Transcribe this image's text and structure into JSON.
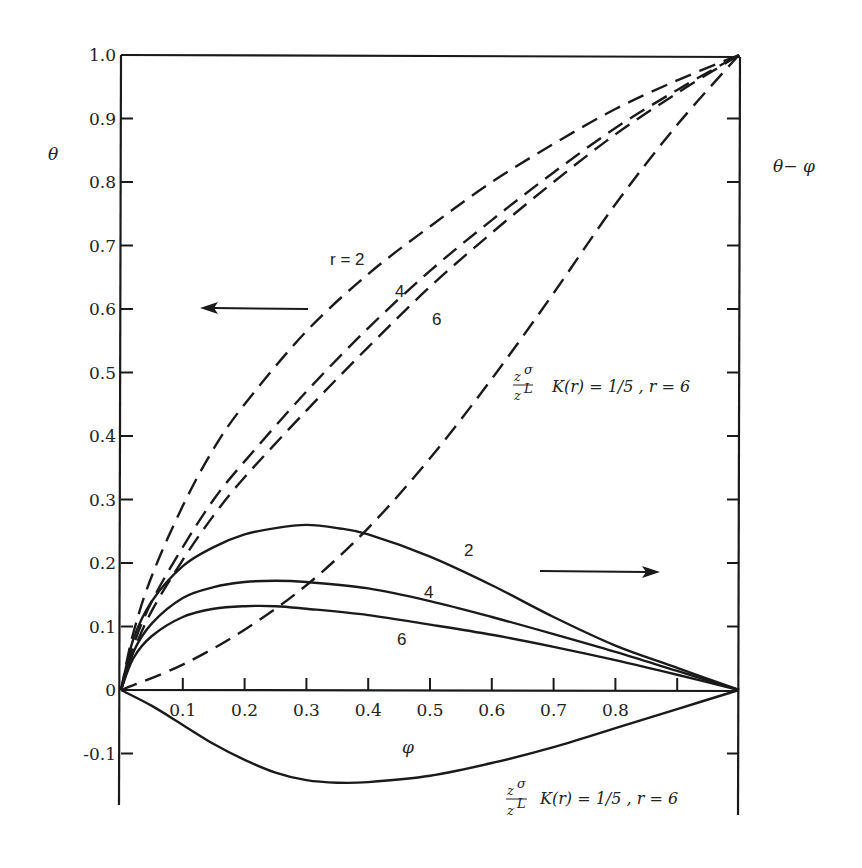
{
  "chart_data": {
    "type": "line",
    "title": "",
    "xlabel": "φ",
    "ylabel_left": "θ",
    "ylabel_right": "θ − φ",
    "xlim": [
      0,
      1.0
    ],
    "ylim": [
      -0.15,
      1.0
    ],
    "grid": false,
    "x_ticks": [
      0.1,
      0.2,
      0.3,
      0.4,
      0.5,
      0.6,
      0.7,
      0.8,
      0.9
    ],
    "x_tick_labels": [
      "0.1",
      "0.2",
      "0.3",
      "0.4",
      "0.5",
      "0.6",
      "0.7",
      "0.8"
    ],
    "y_ticks": [
      -0.1,
      0,
      0.1,
      0.2,
      0.3,
      0.4,
      0.5,
      0.6,
      0.7,
      0.8,
      0.9,
      1.0
    ],
    "y_tick_labels": [
      "-0.1",
      "0",
      "0.1",
      "0.2",
      "0.3",
      "0.4",
      "0.5",
      "0.6",
      "0.7",
      "0.8",
      "0.9",
      "1.0"
    ],
    "arrows": [
      {
        "direction": "left",
        "meaning": "dashed curves read on θ axis (left)"
      },
      {
        "direction": "right",
        "meaning": "solid curves read on θ−φ axis (right)"
      }
    ],
    "series": [
      {
        "name": "θ, r = 2",
        "style": "dashed",
        "axis": "left",
        "x": [
          0,
          0.02,
          0.05,
          0.1,
          0.15,
          0.2,
          0.3,
          0.4,
          0.5,
          0.6,
          0.7,
          0.8,
          0.9,
          1.0
        ],
        "y": [
          0,
          0.09,
          0.18,
          0.29,
          0.38,
          0.45,
          0.565,
          0.655,
          0.73,
          0.8,
          0.86,
          0.915,
          0.96,
          1.0
        ]
      },
      {
        "name": "θ, r = 4",
        "style": "dashed",
        "axis": "left",
        "x": [
          0,
          0.02,
          0.05,
          0.1,
          0.15,
          0.2,
          0.3,
          0.4,
          0.5,
          0.6,
          0.7,
          0.8,
          0.9,
          1.0
        ],
        "y": [
          0,
          0.07,
          0.14,
          0.225,
          0.3,
          0.36,
          0.47,
          0.57,
          0.66,
          0.74,
          0.815,
          0.885,
          0.945,
          1.0
        ]
      },
      {
        "name": "θ, r = 6",
        "style": "dashed",
        "axis": "left",
        "x": [
          0,
          0.02,
          0.05,
          0.1,
          0.15,
          0.2,
          0.3,
          0.4,
          0.5,
          0.6,
          0.7,
          0.8,
          0.9,
          1.0
        ],
        "y": [
          0,
          0.06,
          0.125,
          0.205,
          0.275,
          0.335,
          0.44,
          0.54,
          0.635,
          0.72,
          0.8,
          0.875,
          0.94,
          1.0
        ]
      },
      {
        "name": "θ, (z^σ/z^L) K(r) = 1/5, r = 6",
        "style": "dashed",
        "axis": "left",
        "x": [
          0,
          0.1,
          0.2,
          0.3,
          0.4,
          0.5,
          0.6,
          0.7,
          0.8,
          0.9,
          1.0
        ],
        "y": [
          0,
          0.04,
          0.095,
          0.165,
          0.255,
          0.365,
          0.49,
          0.625,
          0.765,
          0.89,
          1.0
        ]
      },
      {
        "name": "θ−φ, r = 2",
        "style": "solid",
        "axis": "right",
        "x": [
          0,
          0.02,
          0.05,
          0.1,
          0.15,
          0.2,
          0.25,
          0.3,
          0.35,
          0.4,
          0.5,
          0.6,
          0.7,
          0.8,
          0.9,
          1.0
        ],
        "y": [
          0,
          0.08,
          0.14,
          0.195,
          0.225,
          0.245,
          0.255,
          0.26,
          0.255,
          0.245,
          0.21,
          0.165,
          0.115,
          0.07,
          0.035,
          0
        ]
      },
      {
        "name": "θ−φ, r = 4",
        "style": "solid",
        "axis": "right",
        "x": [
          0,
          0.02,
          0.05,
          0.1,
          0.15,
          0.2,
          0.25,
          0.3,
          0.4,
          0.5,
          0.6,
          0.7,
          0.8,
          0.9,
          1.0
        ],
        "y": [
          0,
          0.06,
          0.105,
          0.145,
          0.162,
          0.17,
          0.172,
          0.17,
          0.16,
          0.14,
          0.115,
          0.088,
          0.06,
          0.03,
          0
        ]
      },
      {
        "name": "θ−φ, r = 6",
        "style": "solid",
        "axis": "right",
        "x": [
          0,
          0.02,
          0.05,
          0.1,
          0.15,
          0.2,
          0.25,
          0.3,
          0.4,
          0.5,
          0.6,
          0.7,
          0.8,
          0.9,
          1.0
        ],
        "y": [
          0,
          0.05,
          0.085,
          0.115,
          0.128,
          0.132,
          0.132,
          0.128,
          0.118,
          0.103,
          0.087,
          0.068,
          0.047,
          0.024,
          0
        ]
      },
      {
        "name": "θ−φ, (z^σ/z^L) K(r) = 1/5, r = 6",
        "style": "solid",
        "axis": "right",
        "x": [
          0,
          0.05,
          0.1,
          0.15,
          0.2,
          0.25,
          0.3,
          0.35,
          0.4,
          0.5,
          0.6,
          0.7,
          0.8,
          0.9,
          1.0
        ],
        "y": [
          0,
          -0.025,
          -0.055,
          -0.085,
          -0.11,
          -0.13,
          -0.142,
          -0.146,
          -0.145,
          -0.135,
          -0.115,
          -0.09,
          -0.06,
          -0.03,
          0
        ]
      }
    ]
  },
  "labels": {
    "y_left_symbol": "θ",
    "y_right_symbol": "θ− φ",
    "x_symbol": "φ",
    "r2": "r = 2",
    "r4": "4",
    "r6": "6",
    "solid_2": "2",
    "solid_4": "4",
    "solid_6": "6",
    "frac_num": "z",
    "frac_num_sup": "σ",
    "frac_den": "z",
    "frac_den_sup": "L",
    "k_text_upper": "K(r) = 1/5 , r = 6",
    "k_text_lower": "K(r) = 1/5 , r = 6"
  },
  "layout": {
    "plot_left": 121,
    "plot_right": 739,
    "y0_px": 690,
    "y1_px": 55
  }
}
